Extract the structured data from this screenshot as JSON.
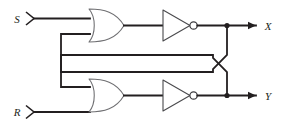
{
  "diagram": {
    "colors": {
      "wire": "#231f20",
      "gate_outline": "#6f6f72",
      "background": "#ffffff"
    },
    "inputs": [
      {
        "id": "s",
        "label": "S",
        "terminal": "arrow-terminal"
      },
      {
        "id": "r",
        "label": "R",
        "terminal": "arrow-terminal"
      }
    ],
    "outputs": [
      {
        "id": "x",
        "label": "X",
        "terminal": "arrowhead"
      },
      {
        "id": "y",
        "label": "Y",
        "terminal": "arrowhead"
      }
    ],
    "gates": [
      {
        "id": "or-top",
        "type": "or-gate",
        "name": "OR gate (top)"
      },
      {
        "id": "inv-top",
        "type": "inverter",
        "name": "Inverter (top)"
      },
      {
        "id": "or-bottom",
        "type": "or-gate",
        "name": "OR gate (bottom)"
      },
      {
        "id": "inv-bottom",
        "type": "inverter",
        "name": "Inverter (bottom)"
      }
    ],
    "nets": [
      {
        "id": "s-to-or-top",
        "name": "S input wire"
      },
      {
        "id": "r-to-or-bottom",
        "name": "R input wire"
      },
      {
        "id": "or-top-to-inv-top",
        "name": "Top OR to top inverter"
      },
      {
        "id": "or-bottom-to-inv-bottom",
        "name": "Bottom OR to bottom inverter"
      },
      {
        "id": "feedback-x-to-or-bottom",
        "name": "X feedback to bottom OR"
      },
      {
        "id": "feedback-y-to-or-top",
        "name": "Y feedback to top OR"
      }
    ],
    "junctions": [
      {
        "id": "x-tap",
        "name": "X output junction"
      },
      {
        "id": "y-tap",
        "name": "Y output junction"
      }
    ],
    "crossover": {
      "id": "wire-crossover",
      "name": "Feedback wire crossover"
    }
  }
}
